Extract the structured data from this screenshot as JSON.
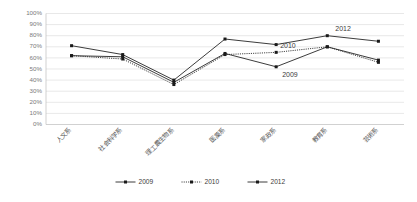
{
  "chart_data": {
    "type": "line",
    "title": "",
    "xlabel": "",
    "ylabel": "",
    "ylim": [
      0,
      100
    ],
    "ytick_labels": [
      "100%",
      "90%",
      "80%",
      "70%",
      "60%",
      "50%",
      "40%",
      "30%",
      "20%",
      "10%",
      "0%"
    ],
    "ytick_values": [
      100,
      90,
      80,
      70,
      60,
      50,
      40,
      30,
      20,
      10,
      0
    ],
    "grid": true,
    "legend_position": "bottom-center",
    "categories": [
      "人文系",
      "社会科学系",
      "理工農生物系",
      "医薬系",
      "家政系",
      "教育系",
      "芸術系"
    ],
    "series": [
      {
        "name": "2009",
        "style": "solid",
        "marker": "square",
        "values": [
          62,
          61,
          38,
          64,
          52,
          70,
          58
        ]
      },
      {
        "name": "2010",
        "style": "dotted",
        "marker": "square",
        "values": [
          62,
          59,
          36,
          63,
          65,
          70,
          56
        ]
      },
      {
        "name": "2012",
        "style": "solid",
        "marker": "square",
        "values": [
          71,
          63,
          40,
          77,
          72,
          80,
          75
        ]
      }
    ],
    "annotations": [
      {
        "text": "2009",
        "series": "2009",
        "x_category": "家政系"
      },
      {
        "text": "2010",
        "series": "2010",
        "x_category": "家政系"
      },
      {
        "text": "2012",
        "series": "2012",
        "x_category": "教育系"
      }
    ],
    "colors": {
      "line": "#262626",
      "marker": "#1a1a1a",
      "grid": "#d9d9d9",
      "axis": "#bdbdbd",
      "tick_label": "#7a7a7a",
      "category_label": "#555555",
      "background": "#ffffff"
    }
  },
  "legend": {
    "items": [
      {
        "label": "2009",
        "style": "solid"
      },
      {
        "label": "2010",
        "style": "dotted"
      },
      {
        "label": "2012",
        "style": "solid"
      }
    ]
  }
}
